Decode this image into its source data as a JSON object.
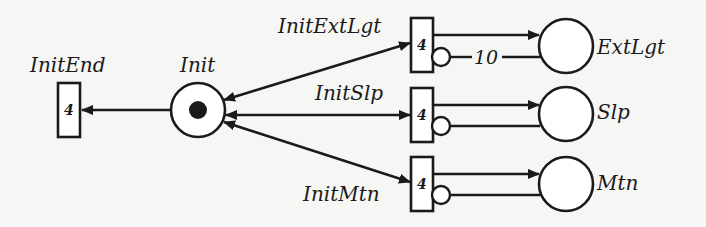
{
  "diagram": {
    "type": "petri-net",
    "colors": {
      "ink": "#1a1a1a",
      "background": "#f6f6f4"
    },
    "places": [
      {
        "id": "init",
        "label": "Init",
        "tokens": 1
      },
      {
        "id": "extlgt",
        "label": "ExtLgt",
        "tokens": 0
      },
      {
        "id": "slp",
        "label": "Slp",
        "tokens": 0
      },
      {
        "id": "mtn",
        "label": "Mtn",
        "tokens": 0
      }
    ],
    "transitions": [
      {
        "id": "initend",
        "label": "InitEnd",
        "priority": "4"
      },
      {
        "id": "initextlgt",
        "label": "InitExtLgt",
        "priority": "4"
      },
      {
        "id": "initslp",
        "label": "InitSlp",
        "priority": "4"
      },
      {
        "id": "initmtn",
        "label": "InitMtn",
        "priority": "4"
      }
    ],
    "arcs": [
      {
        "from": "Init",
        "to": "InitEnd",
        "kind": "input"
      },
      {
        "from": "Init",
        "to": "InitExtLgt",
        "kind": "input"
      },
      {
        "from": "Init",
        "to": "InitSlp",
        "kind": "input"
      },
      {
        "from": "Init",
        "to": "InitMtn",
        "kind": "input"
      },
      {
        "from": "InitExtLgt",
        "to": "Init",
        "kind": "output"
      },
      {
        "from": "InitSlp",
        "to": "Init",
        "kind": "output"
      },
      {
        "from": "InitMtn",
        "to": "Init",
        "kind": "output"
      },
      {
        "from": "InitExtLgt",
        "to": "ExtLgt",
        "kind": "output"
      },
      {
        "from": "InitSlp",
        "to": "Slp",
        "kind": "output"
      },
      {
        "from": "InitMtn",
        "to": "Mtn",
        "kind": "output"
      },
      {
        "from": "ExtLgt",
        "to": "InitExtLgt",
        "kind": "inhibitor",
        "weight": "10"
      },
      {
        "from": "Slp",
        "to": "InitSlp",
        "kind": "inhibitor"
      },
      {
        "from": "Mtn",
        "to": "InitMtn",
        "kind": "inhibitor"
      }
    ],
    "inhibitor_weight_label": "10"
  }
}
